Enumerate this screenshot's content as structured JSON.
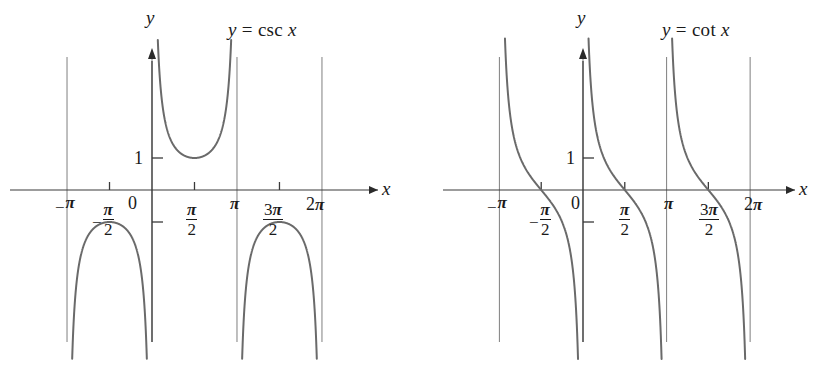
{
  "figure": {
    "width": 822,
    "height": 371,
    "background": "#ffffff",
    "curve_color": "#6a6a6a",
    "axis_color": "#3a3a3a",
    "asymptote_color": "#8a8a8a",
    "text_color": "#1a1a1a"
  },
  "charts": [
    {
      "id": "csc",
      "title": "y = csc x",
      "title_parts": {
        "y": "y",
        "eq": "=",
        "fn": "csc",
        "x": "x"
      },
      "x_axis_label": "x",
      "y_axis_label": "y",
      "origin_label": "0",
      "y_tick_labels": [
        "1"
      ],
      "x_tick_labels": [
        {
          "text": "-π",
          "pi": "π",
          "sign": "−",
          "kind": "simple"
        },
        {
          "text": "-π/2",
          "pi": "π",
          "sign": "−",
          "denom": "2",
          "kind": "fraction"
        },
        {
          "text": "π/2",
          "pi": "π",
          "sign": "",
          "denom": "2",
          "kind": "fraction"
        },
        {
          "text": "π",
          "pi": "π",
          "sign": "",
          "kind": "simple"
        },
        {
          "text": "3π/2",
          "pi": "π",
          "numer": "3",
          "sign": "",
          "denom": "2",
          "kind": "fraction"
        },
        {
          "text": "2π",
          "pi": "π",
          "numer": "2",
          "sign": "",
          "kind": "simple"
        }
      ]
    },
    {
      "id": "cot",
      "title": "y = cot x",
      "title_parts": {
        "y": "y",
        "eq": "=",
        "fn": "cot",
        "x": "x"
      },
      "x_axis_label": "x",
      "y_axis_label": "y",
      "origin_label": "0",
      "y_tick_labels": [
        "1"
      ],
      "x_tick_labels": [
        {
          "text": "-π",
          "pi": "π",
          "sign": "−",
          "kind": "simple"
        },
        {
          "text": "-π/2",
          "pi": "π",
          "sign": "−",
          "denom": "2",
          "kind": "fraction"
        },
        {
          "text": "π/2",
          "pi": "π",
          "sign": "",
          "denom": "2",
          "kind": "fraction"
        },
        {
          "text": "π",
          "pi": "π",
          "sign": "",
          "kind": "simple"
        },
        {
          "text": "3π/2",
          "pi": "π",
          "numer": "3",
          "sign": "",
          "denom": "2",
          "kind": "fraction"
        },
        {
          "text": "2π",
          "pi": "π",
          "numer": "2",
          "sign": "",
          "kind": "simple"
        }
      ]
    }
  ],
  "chart_data": [
    {
      "type": "line",
      "id": "csc",
      "title": "y = csc x",
      "function": "y = csc x",
      "xlabel": "x",
      "ylabel": "y",
      "xlim": [
        -3.4557519,
        6.8067841
      ],
      "ylim": [
        -5.1,
        4.2
      ],
      "grid": false,
      "legend": null,
      "x_ticks": [
        -3.14159265,
        -1.57079633,
        0,
        1.57079633,
        3.14159265,
        4.71238898,
        6.28318531
      ],
      "x_tick_labels": [
        "−π",
        "−π/2",
        "0",
        "π/2",
        "π",
        "3π/2",
        "2π"
      ],
      "y_ticks": [
        -1,
        1
      ],
      "y_tick_labels": [
        "",
        "1"
      ],
      "asymptotes": [
        -3.14159265,
        0,
        3.14159265,
        6.28318531
      ],
      "key_points": [
        {
          "x": -1.57079633,
          "y": -1,
          "note": "local maximum of lower branch"
        },
        {
          "x": 1.57079633,
          "y": 1,
          "note": "local minimum of upper branch"
        },
        {
          "x": 4.71238898,
          "y": -1,
          "note": "local maximum of lower branch"
        }
      ],
      "branches": [
        {
          "domain": [
            -3.14159265,
            0
          ],
          "range": "y ≤ −1",
          "vertex": [
            -1.5708,
            -1
          ]
        },
        {
          "domain": [
            0,
            3.14159265
          ],
          "range": "y ≥ 1",
          "vertex": [
            1.5708,
            1
          ]
        },
        {
          "domain": [
            3.14159265,
            6.28318531
          ],
          "range": "y ≤ −1",
          "vertex": [
            4.7124,
            -1
          ]
        }
      ]
    },
    {
      "type": "line",
      "id": "cot",
      "title": "y = cot x",
      "function": "y = cot x",
      "xlabel": "x",
      "ylabel": "y",
      "xlim": [
        -3.4557519,
        6.8067841
      ],
      "ylim": [
        -5.1,
        4.2
      ],
      "grid": false,
      "legend": null,
      "x_ticks": [
        -3.14159265,
        -1.57079633,
        0,
        1.57079633,
        3.14159265,
        4.71238898,
        6.28318531
      ],
      "x_tick_labels": [
        "−π",
        "−π/2",
        "0",
        "π/2",
        "π",
        "3π/2",
        "2π"
      ],
      "y_ticks": [
        -1,
        1
      ],
      "y_tick_labels": [
        "",
        "1"
      ],
      "asymptotes": [
        -3.14159265,
        0,
        3.14159265,
        6.28318531
      ],
      "key_points": [
        {
          "x": -1.57079633,
          "y": 0,
          "note": "zero crossing"
        },
        {
          "x": 1.57079633,
          "y": 0,
          "note": "zero crossing"
        },
        {
          "x": 4.71238898,
          "y": 0,
          "note": "zero crossing"
        }
      ],
      "branches": [
        {
          "domain": [
            -3.14159265,
            0
          ],
          "decreasing": true,
          "zero": -1.5708
        },
        {
          "domain": [
            0,
            3.14159265
          ],
          "decreasing": true,
          "zero": 1.5708
        },
        {
          "domain": [
            3.14159265,
            6.28318531
          ],
          "decreasing": true,
          "zero": 4.7124
        }
      ]
    }
  ]
}
